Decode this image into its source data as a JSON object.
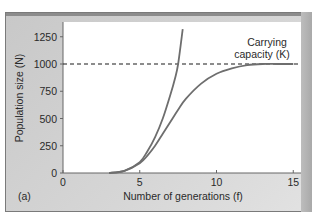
{
  "chart_data": {
    "type": "line",
    "title": "",
    "panel_label": "(a)",
    "xlabel": "Number of generations (f)",
    "ylabel": "Population size (N)",
    "xlim": [
      0,
      15.5
    ],
    "ylim": [
      0,
      1380
    ],
    "x_ticks": [
      0,
      5,
      10,
      15
    ],
    "y_ticks": [
      0,
      250,
      500,
      750,
      1000,
      1250
    ],
    "grid": false,
    "legend": null,
    "annotations": [
      {
        "text_line1": "Carrying",
        "text_line2": "capacity (K)",
        "x": 13.3,
        "y": 1000
      }
    ],
    "reference_lines": [
      {
        "type": "horizontal",
        "y": 1000,
        "style": "dashed",
        "label": "Carrying capacity (K)"
      }
    ],
    "series": [
      {
        "name": "Exponential growth",
        "x": [
          3.0,
          4.0,
          5.0,
          5.5,
          6.0,
          6.5,
          7.0,
          7.3,
          7.5,
          7.8
        ],
        "y": [
          0,
          20,
          100,
          200,
          330,
          500,
          720,
          870,
          1000,
          1320
        ]
      },
      {
        "name": "Logistic growth",
        "x": [
          3.0,
          4.0,
          5.0,
          5.5,
          6.0,
          6.5,
          7.0,
          7.5,
          8.0,
          9.0,
          10.0,
          11.0,
          12.0,
          13.0,
          14.0,
          15.0
        ],
        "y": [
          0,
          20,
          90,
          160,
          250,
          360,
          470,
          580,
          680,
          820,
          910,
          960,
          990,
          1000,
          1000,
          1000
        ]
      }
    ],
    "colors": {
      "curve": "#6e6e6e",
      "dashed_line": "#1a1a1a",
      "plot_bg": "#ffffff",
      "frame_bg": "#d0d0d0"
    }
  }
}
